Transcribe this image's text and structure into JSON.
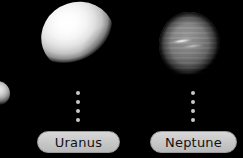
{
  "scene": {
    "background_color": "#000000",
    "width": 243,
    "height": 158
  },
  "planets": [
    {
      "id": "edge",
      "name": "partial-planet",
      "label": "",
      "color": "#d2d2d2",
      "clipped": "left-edge"
    },
    {
      "id": "uranus",
      "name": "Uranus",
      "label": "Uranus",
      "color": "#f4f4f4",
      "clipped": "top-edge"
    },
    {
      "id": "neptune",
      "name": "Neptune",
      "label": "Neptune",
      "color": "#7c7c7c",
      "feature": "bright equatorial cloud streak"
    }
  ],
  "leaders": {
    "dot_color": "#c9c9c9",
    "dot_count": 4
  },
  "labels": {
    "uranus": "Uranus",
    "neptune": "Neptune",
    "pill_fill": "#c9c9c9",
    "pill_text_color": "#121212"
  }
}
